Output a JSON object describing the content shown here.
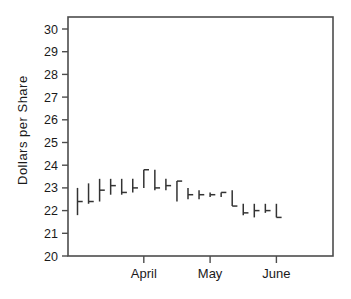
{
  "chart_data": {
    "type": "bar",
    "subtype": "hlc-price-bars",
    "title": "",
    "subtitle": "",
    "xlabel": "",
    "ylabel": "Dollars per Share",
    "ylim": [
      20,
      30
    ],
    "ytick_labels": [
      "30",
      "29",
      "28",
      "27",
      "26",
      "25",
      "24",
      "23",
      "22",
      "21",
      "20"
    ],
    "ytick_values": [
      30,
      29,
      28,
      27,
      26,
      25,
      24,
      23,
      22,
      21,
      20
    ],
    "xtick_labels": [
      "April",
      "May",
      "June"
    ],
    "xtick_positions": [
      7,
      13,
      19
    ],
    "grid": false,
    "legend": null,
    "annotations": [],
    "axis_color": "#4d4d4d",
    "bar_color": "#333333",
    "background": "#ffffff",
    "series": [
      {
        "name": "Price range",
        "bars": [
          {
            "index": 1,
            "high": 23.0,
            "low": 21.8,
            "close": 22.4
          },
          {
            "index": 2,
            "high": 23.2,
            "low": 22.3,
            "close": 22.4
          },
          {
            "index": 3,
            "high": 23.4,
            "low": 22.4,
            "close": 22.9
          },
          {
            "index": 4,
            "high": 23.4,
            "low": 22.7,
            "close": 23.1
          },
          {
            "index": 5,
            "high": 23.4,
            "low": 22.7,
            "close": 22.8
          },
          {
            "index": 6,
            "high": 23.4,
            "low": 22.8,
            "close": 23.0
          },
          {
            "index": 7,
            "high": 23.8,
            "low": 23.0,
            "close": 23.8
          },
          {
            "index": 8,
            "high": 23.8,
            "low": 22.9,
            "close": 23.0
          },
          {
            "index": 9,
            "high": 23.4,
            "low": 22.9,
            "close": 23.1
          },
          {
            "index": 10,
            "high": 23.3,
            "low": 22.4,
            "close": 23.3
          },
          {
            "index": 11,
            "high": 23.0,
            "low": 22.5,
            "close": 22.7
          },
          {
            "index": 12,
            "high": 22.9,
            "low": 22.5,
            "close": 22.7
          },
          {
            "index": 13,
            "high": 22.8,
            "low": 22.6,
            "close": 22.7
          },
          {
            "index": 14,
            "high": 22.8,
            "low": 22.6,
            "close": 22.8
          },
          {
            "index": 15,
            "high": 22.9,
            "low": 22.2,
            "close": 22.2
          },
          {
            "index": 16,
            "high": 22.3,
            "low": 21.8,
            "close": 21.9
          },
          {
            "index": 17,
            "high": 22.3,
            "low": 21.7,
            "close": 22.0
          },
          {
            "index": 18,
            "high": 22.3,
            "low": 21.9,
            "close": 22.0
          },
          {
            "index": 19,
            "high": 22.3,
            "low": 21.7,
            "close": 21.7
          }
        ]
      }
    ]
  }
}
